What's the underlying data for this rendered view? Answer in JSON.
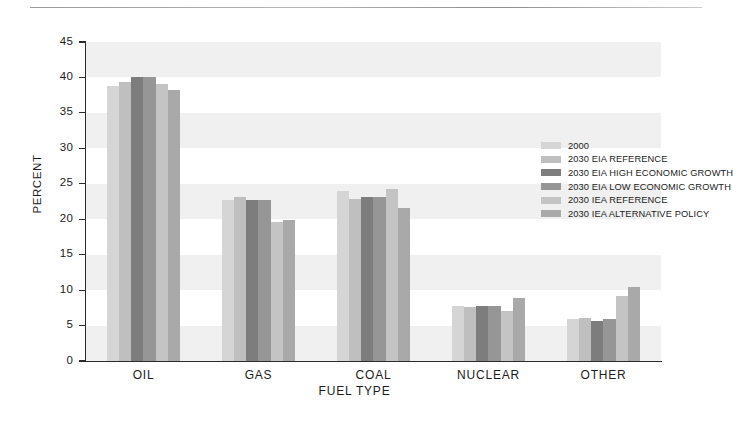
{
  "chart_data": {
    "type": "bar",
    "title": "",
    "xlabel": "FUEL TYPE",
    "ylabel": "PERCENT",
    "ylim": [
      0,
      45
    ],
    "ytick_step": 5,
    "yticks": [
      "45",
      "40",
      "35",
      "30",
      "25",
      "20",
      "15",
      "10",
      "5",
      "0"
    ],
    "grid": "horizontal-bands",
    "legend_position": "upper-right-inside",
    "categories": [
      "OIL",
      "GAS",
      "COAL",
      "NUCLEAR",
      "OTHER"
    ],
    "series": [
      {
        "name": "2000",
        "color": "#d5d5d5",
        "values": [
          38.8,
          22.7,
          24.0,
          7.7,
          5.9
        ]
      },
      {
        "name": "2030 EIA REFERENCE",
        "color": "#bfbfbf",
        "values": [
          39.4,
          23.1,
          22.9,
          7.6,
          6.0
        ]
      },
      {
        "name": "2030 EIA HIGH ECONOMIC GROWTH",
        "color": "#7d7d7d",
        "values": [
          40.0,
          22.7,
          23.1,
          7.8,
          5.6
        ]
      },
      {
        "name": "2030 EIA LOW ECONOMIC GROWTH",
        "color": "#969696",
        "values": [
          40.0,
          22.7,
          23.1,
          7.8,
          5.9
        ]
      },
      {
        "name": "2030 IEA REFERENCE",
        "color": "#c4c4c4",
        "values": [
          39.1,
          19.6,
          24.2,
          7.0,
          9.2
        ]
      },
      {
        "name": "2030 IEA ALTERNATIVE POLICY",
        "color": "#a9a9a9",
        "values": [
          38.2,
          19.9,
          21.6,
          8.9,
          10.5
        ]
      }
    ]
  }
}
